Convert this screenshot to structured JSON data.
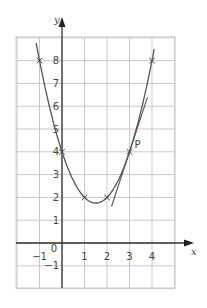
{
  "chart_data": {
    "type": "line",
    "title": "",
    "xlabel": "x",
    "ylabel": "y",
    "xlim": [
      -2,
      5
    ],
    "ylim": [
      -2,
      9
    ],
    "grid": true,
    "x_ticks": [
      "-1",
      "0",
      "1",
      "2",
      "3",
      "4"
    ],
    "y_ticks": [
      "-1",
      "1",
      "2",
      "3",
      "4",
      "5",
      "6",
      "7",
      "8"
    ],
    "series": [
      {
        "name": "curve",
        "function": "y = x^2 - 3x + 4",
        "marked_points": [
          [
            -1,
            8
          ],
          [
            0,
            4
          ],
          [
            1,
            2
          ],
          [
            2,
            2
          ],
          [
            3,
            4
          ],
          [
            4,
            8
          ]
        ]
      },
      {
        "name": "tangent at P",
        "function": "y = 3x - 5",
        "x_range": [
          2.2,
          3.8
        ]
      }
    ],
    "annotations": [
      {
        "text": "P",
        "x": 3,
        "y": 4
      }
    ]
  },
  "labels": {
    "x_axis": "x",
    "y_axis": "y",
    "origin": "0",
    "point": "P"
  }
}
